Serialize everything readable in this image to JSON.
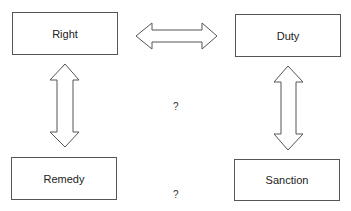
{
  "diagram": {
    "nodes": {
      "right": "Right",
      "duty": "Duty",
      "remedy": "Remedy",
      "sanction": "Sanction"
    },
    "connectors": [
      {
        "from": "Right",
        "to": "Duty",
        "type": "double-arrow"
      },
      {
        "from": "Right",
        "to": "Remedy",
        "type": "double-arrow"
      },
      {
        "from": "Duty",
        "to": "Sanction",
        "type": "double-arrow"
      }
    ],
    "question_marks": {
      "middle": "?",
      "bottom": "?"
    }
  }
}
